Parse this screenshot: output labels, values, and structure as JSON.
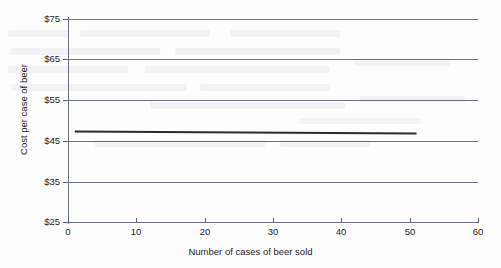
{
  "chart_data": {
    "type": "line",
    "title": "",
    "xlabel": "Number of cases of beer sold",
    "ylabel": "Cost per case of beer",
    "xlim": [
      0,
      60
    ],
    "ylim": [
      25,
      75
    ],
    "xticks": [
      0,
      10,
      20,
      30,
      40,
      50,
      60
    ],
    "xtick_labels": [
      "0",
      "10",
      "20",
      "30",
      "40",
      "50",
      "60"
    ],
    "yticks": [
      25,
      35,
      45,
      55,
      65,
      75
    ],
    "ytick_labels": [
      "$25",
      "$35",
      "$45",
      "$55",
      "$65",
      "$75"
    ],
    "grid": "horizontal",
    "legend": "none",
    "series": [
      {
        "name": "Cost per case of beer",
        "color": "#2b2b33",
        "x": [
          1,
          51
        ],
        "values": [
          47.3,
          46.8
        ]
      }
    ],
    "annotations": []
  },
  "axis": {
    "y_title": "Cost per case of beer",
    "x_title": "Number of cases of beer sold"
  },
  "style": {
    "grid_color": "#6b6f86",
    "axis_color": "#6b6f86",
    "series_color": "#2b2b33",
    "background": "#fdfdfd",
    "text_color": "#1c1c1c"
  }
}
